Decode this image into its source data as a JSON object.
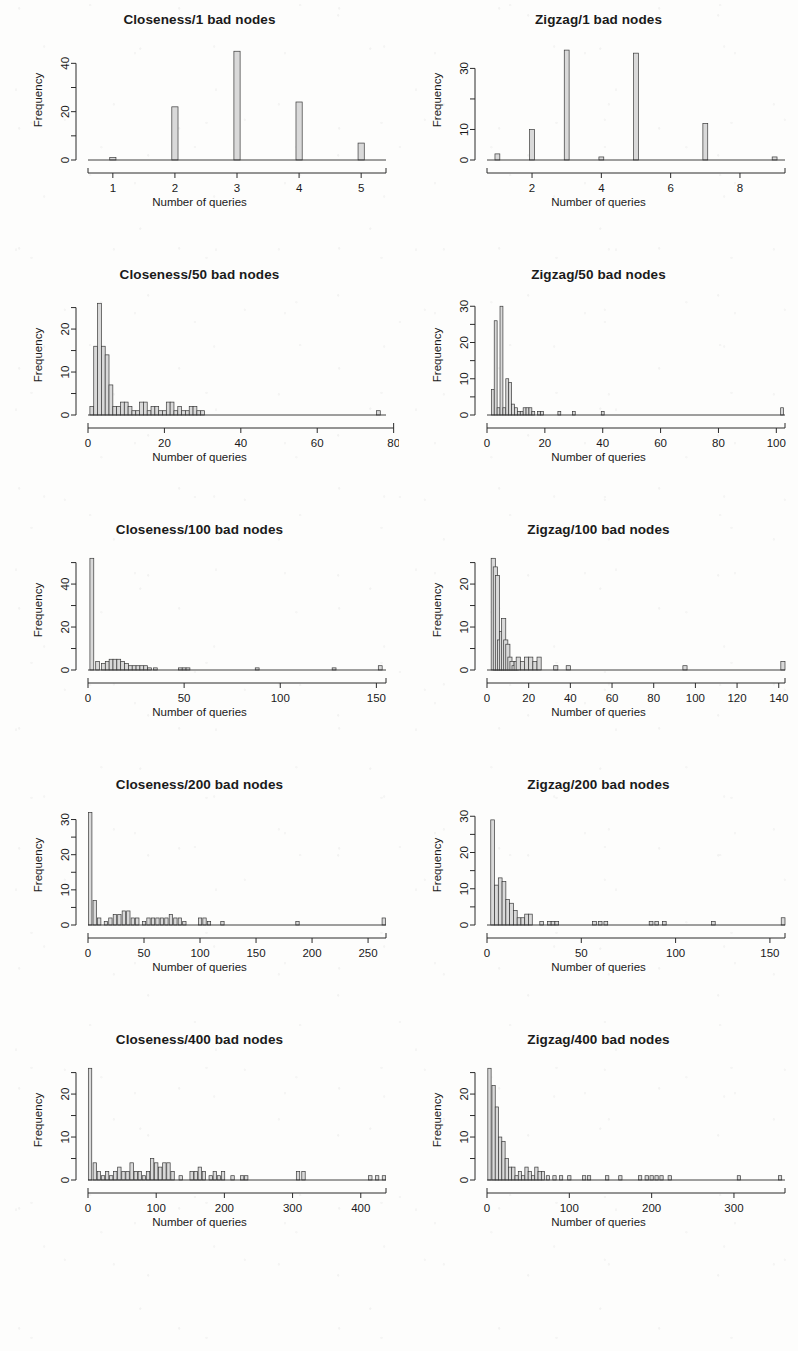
{
  "figure": {
    "layout": "2 columns x 5 rows of histograms",
    "columns": [
      "Closeness",
      "Zigzag"
    ]
  },
  "common": {
    "xlabel": "Number of queries",
    "ylabel": "Frequency"
  },
  "chart_data": [
    {
      "type": "bar",
      "title": "Closeness/1 bad nodes",
      "xlabel": "Number of queries",
      "ylabel": "Frequency",
      "xlim": [
        0.6,
        5.4
      ],
      "ylim": [
        0,
        48
      ],
      "xticks": [
        1,
        2,
        3,
        4,
        5
      ],
      "yticks": [
        0,
        20,
        40
      ],
      "yminorticks": [
        10,
        30
      ],
      "grid": false,
      "legend": null,
      "binwidth": 0.1,
      "x": [
        1,
        2,
        3,
        4,
        5
      ],
      "values": [
        1,
        22,
        45,
        24,
        7
      ]
    },
    {
      "type": "bar",
      "title": "Zigzag/1 bad nodes",
      "xlabel": "Number of queries",
      "ylabel": "Frequency",
      "xlim": [
        0.7,
        9.3
      ],
      "ylim": [
        0,
        38
      ],
      "xticks": [
        2,
        4,
        6,
        8
      ],
      "yticks": [
        0,
        10,
        30
      ],
      "yminorticks": [
        20
      ],
      "grid": false,
      "legend": null,
      "binwidth": 0.14,
      "x": [
        1,
        2,
        3,
        4,
        5,
        7,
        9
      ],
      "values": [
        2,
        10,
        36,
        1,
        35,
        12,
        1
      ]
    },
    {
      "type": "bar",
      "title": "Closeness/50 bad nodes",
      "xlabel": "Number of queries",
      "ylabel": "Frequency",
      "xlim": [
        0,
        78
      ],
      "ylim": [
        0,
        27
      ],
      "xticks": [
        0,
        20,
        40,
        60,
        80
      ],
      "yticks": [
        0,
        10,
        20
      ],
      "yminorticks": [
        5,
        15,
        25
      ],
      "grid": false,
      "legend": null,
      "binwidth": 1,
      "x": [
        1,
        2,
        3,
        4,
        5,
        6,
        7,
        8,
        9,
        10,
        11,
        12,
        13,
        14,
        15,
        16,
        17,
        18,
        19,
        20,
        21,
        22,
        23,
        24,
        25,
        26,
        27,
        28,
        29,
        30,
        76
      ],
      "values": [
        2,
        16,
        26,
        16,
        14,
        7,
        2,
        2,
        3,
        3,
        2,
        1,
        1,
        3,
        3,
        1,
        2,
        2,
        1,
        1,
        3,
        3,
        1,
        2,
        1,
        1,
        2,
        2,
        1,
        1,
        1
      ]
    },
    {
      "type": "bar",
      "title": "Zigzag/50 bad nodes",
      "xlabel": "Number of queries",
      "ylabel": "Frequency",
      "xlim": [
        0,
        103
      ],
      "ylim": [
        0,
        32
      ],
      "xticks": [
        0,
        20,
        40,
        60,
        80,
        100
      ],
      "yticks": [
        0,
        10,
        20,
        30
      ],
      "yminorticks": [
        5,
        15,
        25
      ],
      "grid": false,
      "legend": null,
      "binwidth": 1,
      "x": [
        2,
        3,
        4,
        5,
        6,
        7,
        8,
        9,
        10,
        11,
        12,
        13,
        14,
        15,
        16,
        18,
        19,
        25,
        30,
        40,
        102
      ],
      "values": [
        7,
        26,
        2,
        30,
        2,
        10,
        9,
        3,
        2,
        1,
        1,
        2,
        2,
        2,
        1,
        1,
        1,
        1,
        1,
        1,
        2
      ]
    },
    {
      "type": "bar",
      "title": "Closeness/100 bad nodes",
      "xlabel": "Number of queries",
      "ylabel": "Frequency",
      "xlim": [
        0,
        155
      ],
      "ylim": [
        0,
        54
      ],
      "xticks": [
        0,
        50,
        100,
        150
      ],
      "yticks": [
        0,
        20,
        40
      ],
      "yminorticks": [
        10,
        30,
        50
      ],
      "grid": false,
      "legend": null,
      "binwidth": 2,
      "x": [
        2,
        5,
        8,
        10,
        12,
        14,
        16,
        18,
        20,
        22,
        24,
        26,
        28,
        30,
        32,
        35,
        48,
        50,
        52,
        88,
        128,
        152
      ],
      "values": [
        52,
        4,
        3,
        4,
        5,
        5,
        5,
        4,
        3,
        2,
        2,
        2,
        2,
        2,
        1,
        1,
        1,
        1,
        1,
        1,
        1,
        2
      ]
    },
    {
      "type": "bar",
      "title": "Zigzag/100 bad nodes",
      "xlabel": "Number of queries",
      "ylabel": "Frequency",
      "xlim": [
        0,
        143
      ],
      "ylim": [
        0,
        27
      ],
      "xticks": [
        0,
        20,
        40,
        60,
        80,
        100,
        120,
        140
      ],
      "yticks": [
        0,
        10,
        20
      ],
      "yminorticks": [
        5,
        15,
        25
      ],
      "grid": false,
      "legend": null,
      "binwidth": 2,
      "x": [
        3,
        4,
        5,
        6,
        7,
        8,
        9,
        10,
        11,
        12,
        13,
        14,
        15,
        17,
        19,
        21,
        23,
        25,
        33,
        39,
        95,
        142
      ],
      "values": [
        26,
        24,
        22,
        7,
        9,
        12,
        7,
        6,
        3,
        2,
        1,
        2,
        3,
        2,
        3,
        3,
        2,
        3,
        1,
        1,
        1,
        2
      ]
    },
    {
      "type": "bar",
      "title": "Closeness/200 bad nodes",
      "xlabel": "Number of queries",
      "ylabel": "Frequency",
      "xlim": [
        0,
        266
      ],
      "ylim": [
        0,
        33
      ],
      "xticks": [
        0,
        50,
        100,
        150,
        200,
        250
      ],
      "yticks": [
        0,
        10,
        20,
        30
      ],
      "yminorticks": [
        5,
        15,
        25
      ],
      "grid": false,
      "legend": null,
      "binwidth": 3,
      "x": [
        2,
        6,
        10,
        16,
        20,
        24,
        28,
        32,
        36,
        40,
        44,
        50,
        54,
        58,
        62,
        66,
        70,
        74,
        78,
        82,
        86,
        100,
        104,
        108,
        120,
        187,
        264
      ],
      "values": [
        32,
        7,
        2,
        1,
        2,
        3,
        3,
        4,
        4,
        2,
        2,
        1,
        2,
        2,
        2,
        2,
        2,
        3,
        2,
        2,
        1,
        2,
        2,
        1,
        1,
        1,
        2
      ]
    },
    {
      "type": "bar",
      "title": "Zigzag/200 bad nodes",
      "xlabel": "Number of queries",
      "ylabel": "Frequency",
      "xlim": [
        0,
        158
      ],
      "ylim": [
        0,
        32
      ],
      "xticks": [
        0,
        50,
        100,
        150
      ],
      "yticks": [
        0,
        10,
        20,
        30
      ],
      "yminorticks": [
        5,
        15,
        25
      ],
      "grid": false,
      "legend": null,
      "binwidth": 2,
      "x": [
        3,
        5,
        7,
        9,
        11,
        13,
        15,
        17,
        19,
        21,
        23,
        29,
        33,
        35,
        37,
        57,
        60,
        63,
        87,
        90,
        94,
        120,
        157
      ],
      "values": [
        29,
        11,
        13,
        12,
        7,
        6,
        4,
        2,
        2,
        3,
        3,
        1,
        1,
        1,
        1,
        1,
        1,
        1,
        1,
        1,
        1,
        1,
        2
      ]
    },
    {
      "type": "bar",
      "title": "Closeness/400 bad nodes",
      "xlabel": "Number of queries",
      "ylabel": "Frequency",
      "xlim": [
        0,
        437
      ],
      "ylim": [
        0,
        27
      ],
      "xticks": [
        0,
        100,
        200,
        300,
        400
      ],
      "yticks": [
        0,
        10,
        20
      ],
      "yminorticks": [
        5,
        15,
        25
      ],
      "grid": false,
      "legend": null,
      "binwidth": 5,
      "x": [
        3,
        10,
        16,
        22,
        28,
        34,
        40,
        46,
        52,
        58,
        64,
        70,
        76,
        82,
        88,
        94,
        100,
        106,
        112,
        118,
        124,
        136,
        152,
        158,
        164,
        170,
        180,
        186,
        192,
        198,
        212,
        226,
        232,
        308,
        316,
        414,
        424,
        434
      ],
      "values": [
        26,
        4,
        2,
        1,
        2,
        1,
        2,
        3,
        2,
        2,
        4,
        2,
        2,
        1,
        2,
        5,
        4,
        3,
        4,
        4,
        2,
        1,
        2,
        2,
        3,
        2,
        1,
        2,
        1,
        2,
        1,
        1,
        1,
        2,
        2,
        1,
        1,
        1
      ]
    },
    {
      "type": "bar",
      "title": "Zigzag/400 bad nodes",
      "xlabel": "Number of queries",
      "ylabel": "Frequency",
      "xlim": [
        0,
        362
      ],
      "ylim": [
        0,
        27
      ],
      "xticks": [
        0,
        100,
        200,
        300
      ],
      "yticks": [
        0,
        10,
        20
      ],
      "yminorticks": [
        5,
        15,
        25
      ],
      "grid": false,
      "legend": null,
      "binwidth": 4,
      "x": [
        3,
        8,
        12,
        16,
        20,
        24,
        28,
        32,
        36,
        40,
        44,
        48,
        52,
        56,
        60,
        64,
        68,
        74,
        82,
        90,
        100,
        118,
        124,
        146,
        162,
        186,
        194,
        200,
        206,
        212,
        222,
        306,
        356
      ],
      "values": [
        26,
        22,
        17,
        10,
        9,
        5,
        3,
        3,
        1,
        2,
        1,
        3,
        2,
        1,
        3,
        2,
        2,
        1,
        1,
        1,
        1,
        1,
        1,
        1,
        1,
        1,
        1,
        1,
        1,
        1,
        1,
        1,
        1
      ]
    }
  ]
}
